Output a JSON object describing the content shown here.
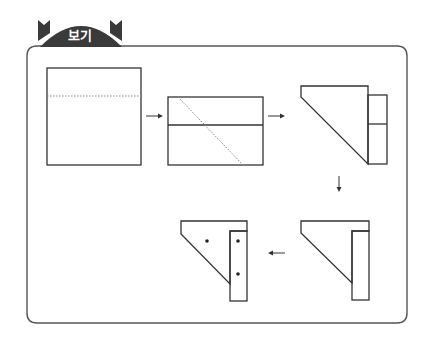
{
  "header": {
    "tab_label": "보기"
  },
  "colors": {
    "line": "#333333",
    "tab": "#3a3a3a",
    "frame": "#555555",
    "background": "#ffffff"
  },
  "diagram": {
    "steps": [
      {
        "id": 1,
        "shape": "square",
        "fold_line": "horizontal-dotted"
      },
      {
        "id": 2,
        "shape": "rectangle",
        "fold_line": "diagonal-dotted"
      },
      {
        "id": 3,
        "shape": "folded-triangle-with-strip"
      },
      {
        "id": 4,
        "shape": "folded-triangle-with-narrow-strip"
      },
      {
        "id": 5,
        "shape": "folded-triangle-with-strip",
        "holes": 3
      }
    ],
    "arrows": [
      {
        "from": 1,
        "to": 2,
        "direction": "right",
        "glyph": "→"
      },
      {
        "from": 2,
        "to": 3,
        "direction": "right",
        "glyph": "→"
      },
      {
        "from": 3,
        "to": 4,
        "direction": "down",
        "glyph": "↓"
      },
      {
        "from": 4,
        "to": 5,
        "direction": "left",
        "glyph": "←"
      }
    ]
  }
}
